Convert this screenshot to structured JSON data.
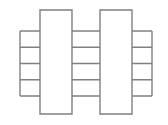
{
  "figure": {
    "title": "",
    "background_color": "#ffffff",
    "line_color": "#808080",
    "fill_color": "#ffffff",
    "line_width": 1.4,
    "width": 168,
    "height": 125
  },
  "chart_data": {
    "type": "diagram",
    "title": "",
    "grid": false,
    "legend": null,
    "xlabel": "",
    "ylabel": ""
  },
  "geometry": {
    "outer_left_x": 20,
    "outer_right_x": 152,
    "plates": [
      {
        "name": "left-plate",
        "x": 40,
        "y": 10,
        "width": 32,
        "height": 104
      },
      {
        "name": "right-plate",
        "x": 100,
        "y": 10,
        "width": 32,
        "height": 104
      }
    ],
    "band_top_y": 31,
    "band_spacing": 16.25,
    "band_count": 4,
    "band_line_ys": [
      31,
      47.25,
      63.5,
      79.75,
      96
    ],
    "vertical_dividers_x": [
      20,
      40,
      72,
      100,
      132,
      152
    ]
  },
  "labels": {
    "plate_left": "left-plate",
    "plate_right": "right-plate",
    "band_1": "band-1",
    "band_2": "band-2",
    "band_3": "band-3",
    "band_4": "band-4"
  }
}
